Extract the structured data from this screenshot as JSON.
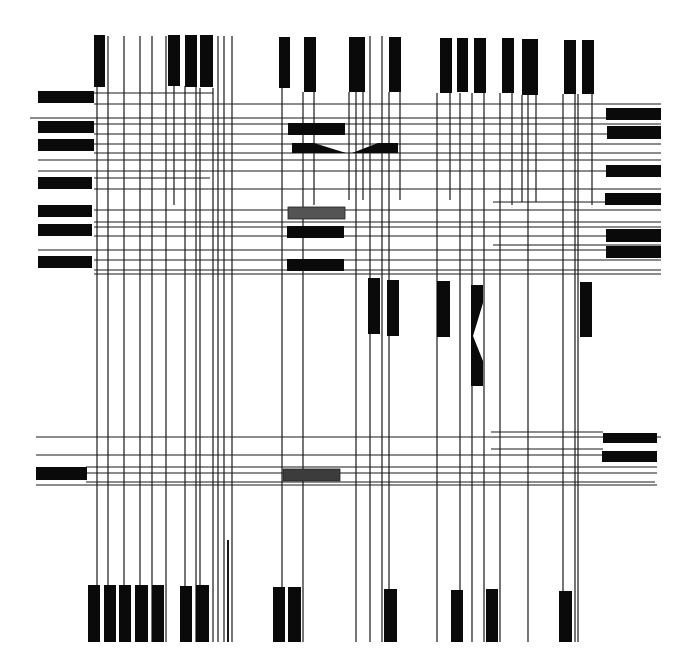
{
  "artwork": {
    "title": "Abstract composition of black bars and lines",
    "width": 691,
    "height": 670,
    "background": "#ffffff",
    "colors": {
      "ink": "#0a0a0a",
      "line": "#1a1a1a",
      "gray_light": "#545454",
      "gray_dark": "#3c3c3c"
    },
    "vertical_lines": [
      {
        "x": 97,
        "y1": 87,
        "y2": 642
      },
      {
        "x": 108,
        "y1": 36,
        "y2": 642
      },
      {
        "x": 124,
        "y1": 36,
        "y2": 642
      },
      {
        "x": 140,
        "y1": 36,
        "y2": 642
      },
      {
        "x": 152,
        "y1": 36,
        "y2": 642
      },
      {
        "x": 166,
        "y1": 36,
        "y2": 642
      },
      {
        "x": 174,
        "y1": 86,
        "y2": 205
      },
      {
        "x": 185,
        "y1": 86,
        "y2": 642
      },
      {
        "x": 196,
        "y1": 86,
        "y2": 642
      },
      {
        "x": 200,
        "y1": 88,
        "y2": 642
      },
      {
        "x": 213,
        "y1": 88,
        "y2": 642
      },
      {
        "x": 218,
        "y1": 36,
        "y2": 642
      },
      {
        "x": 224,
        "y1": 36,
        "y2": 642
      },
      {
        "x": 232,
        "y1": 36,
        "y2": 642
      },
      {
        "x": 282,
        "y1": 88,
        "y2": 642
      },
      {
        "x": 303,
        "y1": 92,
        "y2": 642
      },
      {
        "x": 314,
        "y1": 92,
        "y2": 205
      },
      {
        "x": 349,
        "y1": 92,
        "y2": 200
      },
      {
        "x": 356,
        "y1": 92,
        "y2": 642
      },
      {
        "x": 363,
        "y1": 92,
        "y2": 200
      },
      {
        "x": 370,
        "y1": 36,
        "y2": 642
      },
      {
        "x": 382,
        "y1": 36,
        "y2": 642
      },
      {
        "x": 389,
        "y1": 92,
        "y2": 642
      },
      {
        "x": 400,
        "y1": 92,
        "y2": 200
      },
      {
        "x": 437,
        "y1": 93,
        "y2": 642
      },
      {
        "x": 450,
        "y1": 93,
        "y2": 200
      },
      {
        "x": 460,
        "y1": 93,
        "y2": 642
      },
      {
        "x": 472,
        "y1": 93,
        "y2": 642
      },
      {
        "x": 484,
        "y1": 93,
        "y2": 642
      },
      {
        "x": 500,
        "y1": 93,
        "y2": 642
      },
      {
        "x": 512,
        "y1": 93,
        "y2": 205
      },
      {
        "x": 522,
        "y1": 95,
        "y2": 202
      },
      {
        "x": 528,
        "y1": 95,
        "y2": 642
      },
      {
        "x": 536,
        "y1": 95,
        "y2": 202
      },
      {
        "x": 563,
        "y1": 94,
        "y2": 642
      },
      {
        "x": 575,
        "y1": 94,
        "y2": 642
      },
      {
        "x": 578,
        "y1": 94,
        "y2": 642
      },
      {
        "x": 592,
        "y1": 94,
        "y2": 205
      }
    ],
    "horizontal_lines": [
      {
        "y": 93,
        "x1": 94,
        "x2": 213
      },
      {
        "y": 104,
        "x1": 94,
        "x2": 661
      },
      {
        "y": 118,
        "x1": 30,
        "x2": 661
      },
      {
        "y": 124,
        "x1": 94,
        "x2": 661
      },
      {
        "y": 134,
        "x1": 94,
        "x2": 661
      },
      {
        "y": 144,
        "x1": 94,
        "x2": 661
      },
      {
        "y": 153,
        "x1": 94,
        "x2": 661
      },
      {
        "y": 160,
        "x1": 38,
        "x2": 661
      },
      {
        "y": 171,
        "x1": 38,
        "x2": 661
      },
      {
        "y": 178,
        "x1": 94,
        "x2": 210
      },
      {
        "y": 189,
        "x1": 94,
        "x2": 661
      },
      {
        "y": 202,
        "x1": 493,
        "x2": 661
      },
      {
        "y": 210,
        "x1": 94,
        "x2": 661
      },
      {
        "y": 222,
        "x1": 94,
        "x2": 661
      },
      {
        "y": 227,
        "x1": 94,
        "x2": 661
      },
      {
        "y": 236,
        "x1": 94,
        "x2": 661
      },
      {
        "y": 245,
        "x1": 493,
        "x2": 661
      },
      {
        "y": 250,
        "x1": 38,
        "x2": 661
      },
      {
        "y": 260,
        "x1": 94,
        "x2": 661
      },
      {
        "y": 270,
        "x1": 94,
        "x2": 661
      },
      {
        "y": 274,
        "x1": 94,
        "x2": 661
      },
      {
        "y": 437,
        "x1": 36,
        "x2": 661
      },
      {
        "y": 432,
        "x1": 491,
        "x2": 603
      },
      {
        "y": 449,
        "x1": 491,
        "x2": 603
      },
      {
        "y": 455,
        "x1": 36,
        "x2": 603
      },
      {
        "y": 467,
        "x1": 86,
        "x2": 657
      },
      {
        "y": 473,
        "x1": 36,
        "x2": 657
      },
      {
        "y": 482,
        "x1": 86,
        "x2": 655
      },
      {
        "y": 485,
        "x1": 36,
        "x2": 657
      }
    ],
    "black_blocks": [
      {
        "name": "top-bar-1",
        "x": 94,
        "y": 35,
        "w": 11,
        "h": 52
      },
      {
        "name": "top-bar-2",
        "x": 168,
        "y": 35,
        "w": 12,
        "h": 51
      },
      {
        "name": "top-bar-3",
        "x": 185,
        "y": 35,
        "w": 12,
        "h": 52
      },
      {
        "name": "top-bar-4",
        "x": 200,
        "y": 35,
        "w": 13,
        "h": 52
      },
      {
        "name": "top-bar-5",
        "x": 279,
        "y": 37,
        "w": 11,
        "h": 51
      },
      {
        "name": "top-bar-6",
        "x": 304,
        "y": 37,
        "w": 12,
        "h": 55
      },
      {
        "name": "top-bar-7",
        "x": 349,
        "y": 37,
        "w": 16,
        "h": 55
      },
      {
        "name": "top-bar-8",
        "x": 389,
        "y": 37,
        "w": 12,
        "h": 55
      },
      {
        "name": "top-bar-9",
        "x": 440,
        "y": 38,
        "w": 12,
        "h": 55
      },
      {
        "name": "top-bar-10",
        "x": 457,
        "y": 38,
        "w": 11,
        "h": 54
      },
      {
        "name": "top-bar-11",
        "x": 474,
        "y": 38,
        "w": 12,
        "h": 55
      },
      {
        "name": "top-bar-12",
        "x": 502,
        "y": 38,
        "w": 12,
        "h": 55
      },
      {
        "name": "top-bar-13",
        "x": 522,
        "y": 39,
        "w": 16,
        "h": 56
      },
      {
        "name": "top-bar-14",
        "x": 564,
        "y": 40,
        "w": 12,
        "h": 54
      },
      {
        "name": "top-bar-15",
        "x": 582,
        "y": 40,
        "w": 12,
        "h": 54
      },
      {
        "name": "left-bar-1",
        "x": 38,
        "y": 91,
        "w": 56,
        "h": 12
      },
      {
        "name": "left-bar-2",
        "x": 38,
        "y": 121,
        "w": 56,
        "h": 12
      },
      {
        "name": "left-bar-3",
        "x": 38,
        "y": 139,
        "w": 56,
        "h": 12
      },
      {
        "name": "left-bar-4",
        "x": 38,
        "y": 177,
        "w": 54,
        "h": 12
      },
      {
        "name": "left-bar-5",
        "x": 38,
        "y": 205,
        "w": 54,
        "h": 12
      },
      {
        "name": "left-bar-6",
        "x": 38,
        "y": 224,
        "w": 54,
        "h": 12
      },
      {
        "name": "left-bar-7",
        "x": 38,
        "y": 256,
        "w": 54,
        "h": 12
      },
      {
        "name": "left-bar-8",
        "x": 36,
        "y": 467,
        "w": 51,
        "h": 13
      },
      {
        "name": "right-bar-1",
        "x": 606,
        "y": 108,
        "w": 55,
        "h": 12
      },
      {
        "name": "right-bar-2",
        "x": 607,
        "y": 126,
        "w": 54,
        "h": 13
      },
      {
        "name": "right-bar-3",
        "x": 606,
        "y": 165,
        "w": 55,
        "h": 12
      },
      {
        "name": "right-bar-4",
        "x": 605,
        "y": 193,
        "w": 56,
        "h": 12
      },
      {
        "name": "right-bar-5",
        "x": 606,
        "y": 229,
        "w": 55,
        "h": 13
      },
      {
        "name": "right-bar-6",
        "x": 606,
        "y": 246,
        "w": 55,
        "h": 12
      },
      {
        "name": "right-bar-7",
        "x": 603,
        "y": 433,
        "w": 54,
        "h": 10
      },
      {
        "name": "right-bar-8",
        "x": 602,
        "y": 451,
        "w": 55,
        "h": 11
      },
      {
        "name": "center-bar-1",
        "x": 288,
        "y": 123,
        "w": 57,
        "h": 12
      },
      {
        "name": "center-bar-2",
        "x": 287,
        "y": 226,
        "w": 57,
        "h": 12
      },
      {
        "name": "center-bar-3",
        "x": 287,
        "y": 259,
        "w": 57,
        "h": 12
      },
      {
        "name": "mid-bar-1",
        "x": 368,
        "y": 278,
        "w": 12,
        "h": 56
      },
      {
        "name": "mid-bar-2",
        "x": 387,
        "y": 280,
        "w": 12,
        "h": 56
      },
      {
        "name": "mid-bar-3",
        "x": 437,
        "y": 281,
        "w": 13,
        "h": 56
      },
      {
        "name": "mid-bar-4",
        "x": 580,
        "y": 282,
        "w": 12,
        "h": 55
      },
      {
        "name": "bottom-bar-1",
        "x": 88,
        "y": 585,
        "w": 12,
        "h": 57
      },
      {
        "name": "bottom-bar-2",
        "x": 104,
        "y": 585,
        "w": 12,
        "h": 57
      },
      {
        "name": "bottom-bar-3",
        "x": 119,
        "y": 585,
        "w": 12,
        "h": 57
      },
      {
        "name": "bottom-bar-4",
        "x": 135,
        "y": 585,
        "w": 13,
        "h": 57
      },
      {
        "name": "bottom-bar-5",
        "x": 152,
        "y": 585,
        "w": 12,
        "h": 57
      },
      {
        "name": "bottom-bar-6",
        "x": 180,
        "y": 586,
        "w": 12,
        "h": 56
      },
      {
        "name": "bottom-bar-7",
        "x": 196,
        "y": 585,
        "w": 13,
        "h": 57
      },
      {
        "name": "bottom-bar-8",
        "x": 273,
        "y": 587,
        "w": 12,
        "h": 55
      },
      {
        "name": "bottom-bar-9",
        "x": 288,
        "y": 587,
        "w": 13,
        "h": 55
      },
      {
        "name": "bottom-bar-10",
        "x": 384,
        "y": 589,
        "w": 13,
        "h": 53
      },
      {
        "name": "bottom-bar-11",
        "x": 451,
        "y": 590,
        "w": 12,
        "h": 52
      },
      {
        "name": "bottom-bar-12",
        "x": 486,
        "y": 589,
        "w": 12,
        "h": 53
      },
      {
        "name": "bottom-bar-13",
        "x": 559,
        "y": 591,
        "w": 13,
        "h": 51
      }
    ],
    "gray_blocks": [
      {
        "name": "gray-bar-upper",
        "x": 288,
        "y": 207,
        "w": 57,
        "h": 12,
        "color": "#545454"
      },
      {
        "name": "gray-bar-lower",
        "x": 283,
        "y": 469,
        "w": 57,
        "h": 12,
        "color": "#3c3c3c"
      }
    ],
    "polygons": [
      {
        "name": "wedge-left",
        "points": "292,143 314,143 346,153 292,153"
      },
      {
        "name": "wedge-right",
        "points": "352,153 378,143 398,143 398,153"
      },
      {
        "name": "vertical-hourglass",
        "points": "471,285 483,285 483,303 473,336 483,361 483,386 471,386"
      }
    ],
    "thin_bottom_lines": [
      {
        "x": 228,
        "y1": 540,
        "y2": 642
      }
    ]
  }
}
